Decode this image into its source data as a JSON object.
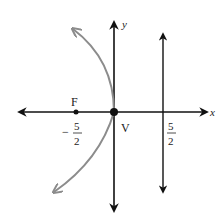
{
  "diagram": {
    "axes": {
      "x_label": "x",
      "y_label": "y"
    },
    "focus": {
      "label": "F",
      "x_value_num": "5",
      "x_value_den": "2",
      "sign": "−"
    },
    "vertex": {
      "label": "V"
    },
    "directrix": {
      "x_value_num": "5",
      "x_value_den": "2"
    },
    "colors": {
      "axes": "#111111",
      "parabola": "#8c8c8c"
    }
  }
}
